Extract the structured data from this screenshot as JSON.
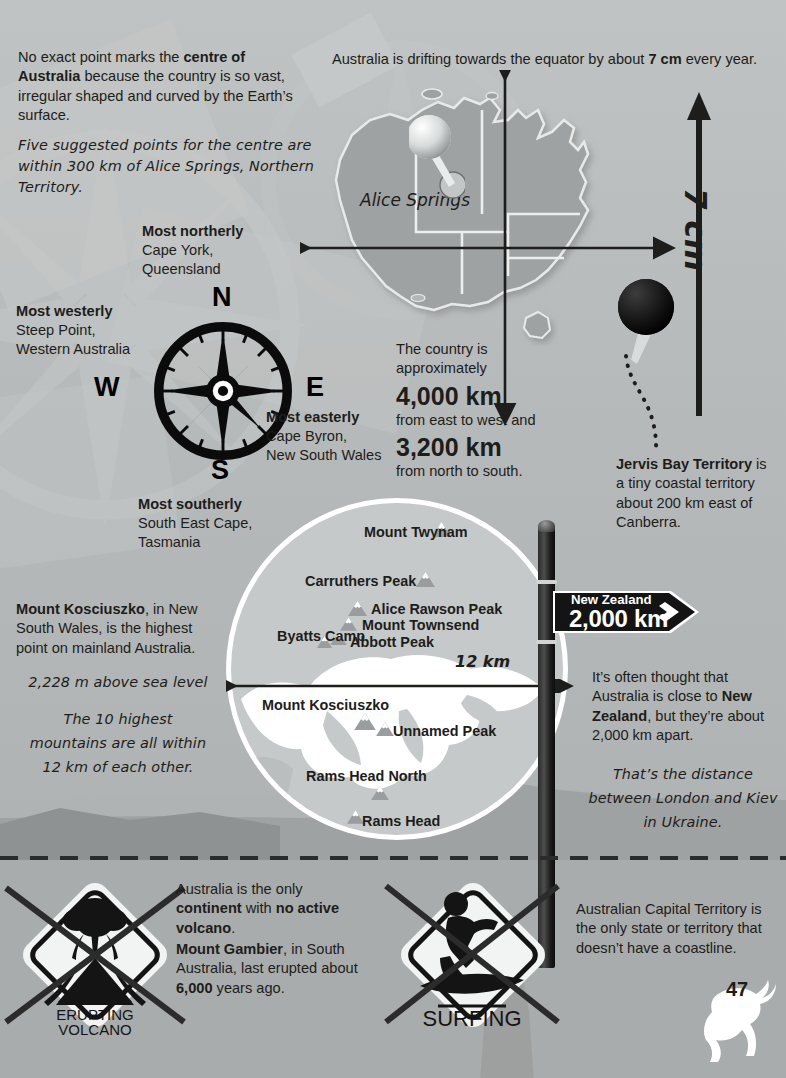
{
  "page": {
    "number": "47"
  },
  "intro": {
    "p1_a": "No exact point marks the ",
    "p1_b": "centre of Australia",
    "p1_c": " because the country is so vast, irregular shaped and curved by the Earth’s surface.",
    "p2": "Five suggested points for the centre are within 300 km of Alice Springs, Northern Territory."
  },
  "drift": {
    "a": "Australia is drifting towards the equator by about ",
    "b": "7 cm",
    "c": " every year.",
    "arrow_label": "7 cm"
  },
  "map": {
    "city_label": "Alice Springs",
    "pin_white_name": "alice-springs-pin",
    "pin_black_name": "jervis-bay-pin"
  },
  "extremes": [
    {
      "heading": "Most northerly",
      "line1": "Cape York,",
      "line2": "Queensland"
    },
    {
      "heading": "Most westerly",
      "line1": "Steep Point,",
      "line2": "Western Australia"
    },
    {
      "heading": "Most easterly",
      "line1": "Cape Byron,",
      "line2": "New South Wales"
    },
    {
      "heading": "Most southerly",
      "line1": "South East Cape,",
      "line2": "Tasmania"
    }
  ],
  "compass": {
    "n": "N",
    "e": "E",
    "s": "S",
    "w": "W"
  },
  "dimensions": {
    "lead1": "The country is",
    "lead2": "approximately",
    "big1": "4,000 km",
    "mid": "from east to west and",
    "big2": "3,200 km",
    "tail": "from north to south."
  },
  "jervis": {
    "bold": "Jervis Bay Territory",
    "rest": " is a tiny coastal territory about 200 km east of Canberra."
  },
  "kosciuszko": {
    "bold": "Mount Kosciuszko",
    "rest": ", in New South Wales, is the highest point on mainland Australia.",
    "elevation": "2,228 m above sea level",
    "note": "The 10 highest mountains are all within 12 km of each other."
  },
  "mountains": {
    "scale_label": "12 km",
    "peaks": [
      {
        "label": "Mount Twynam"
      },
      {
        "label": "Carruthers Peak"
      },
      {
        "label": "Alice Rawson Peak"
      },
      {
        "label": "Mount Townsend"
      },
      {
        "label": "Abbott Peak"
      },
      {
        "label": "Byatts Camp"
      },
      {
        "label": "Mount Kosciuszko"
      },
      {
        "label": "Unnamed Peak"
      },
      {
        "label": "Rams Head North"
      },
      {
        "label": "Rams Head"
      }
    ]
  },
  "signpost": {
    "destination": "New Zealand",
    "distance": "2,000 km"
  },
  "newzealand": {
    "a": "It’s often thought that Australia is close to ",
    "b": "New Zealand",
    "c": ", but they’re about 2,000 km apart.",
    "note": "That’s the distance between London and Kiev in Ukraine."
  },
  "volcano": {
    "sign_line1": "ERUPTING",
    "sign_line2": "VOLCANO",
    "p1_a": "Australia is the only ",
    "p1_b": "continent",
    "p1_c": " with ",
    "p1_d": "no active volcano",
    "p1_e": ".",
    "p2_a": "Mount Gambier",
    "p2_b": ", in South Australia, last erupted about ",
    "p2_c": "6,000",
    "p2_d": " years ago."
  },
  "surfing": {
    "sign_label": "SURFING",
    "text": "Australian Capital Territory is the only state or territory that doesn’t have a coastline."
  },
  "colors": {
    "background": "#b9bcbc",
    "background_bottom": "#a9acac",
    "map_fill": "#9fa2a2",
    "ink": "#1d1d1b",
    "snow": "#ffffff",
    "sign_dark": "#141414"
  }
}
